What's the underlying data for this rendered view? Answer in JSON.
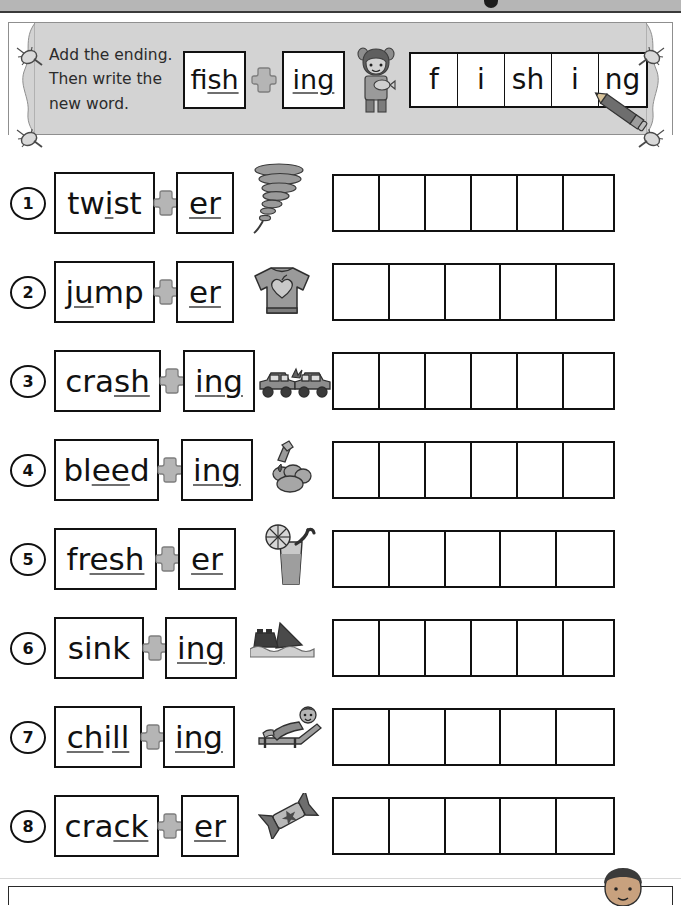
{
  "header": {
    "instruction_line1": "Add the ending.",
    "instruction_line2": "Then write the",
    "instruction_line3": "new word.",
    "example": {
      "base_word": "fish",
      "base_plain": "f",
      "base_underlined": "ish",
      "suffix": "ing",
      "suffix_underlined": "ing",
      "plus_icon": "plus-cross-icon",
      "picture_icon": "girl-with-fish-icon",
      "answer_cells": [
        "f",
        "i",
        "sh",
        "i",
        "ng"
      ],
      "pencil_icon": "pencil-icon"
    },
    "pins": [
      "pin-icon",
      "pin-icon",
      "pin-icon",
      "pin-icon"
    ]
  },
  "rows": [
    {
      "number": "1",
      "base_plain": "tw",
      "base_underlined": "i",
      "base_tail": "st",
      "base_word": "twist",
      "suffix": "er",
      "suffix_underlined": "er",
      "picture_icon": "tornado-twister-icon",
      "picture_label": "twister",
      "answer_cell_count": 6,
      "answer_cells": [
        "",
        "",
        "",
        "",
        "",
        ""
      ]
    },
    {
      "number": "2",
      "base_plain": "j",
      "base_underlined": "u",
      "base_tail": "mp",
      "base_word": "jump",
      "suffix": "er",
      "suffix_underlined": "er",
      "picture_icon": "jumper-sweater-icon",
      "picture_label": "jumper",
      "answer_cell_count": 5,
      "answer_cells": [
        "",
        "",
        "",
        "",
        ""
      ]
    },
    {
      "number": "3",
      "base_plain": "cra",
      "base_underlined": "sh",
      "base_tail": "",
      "base_word": "crash",
      "suffix": "ing",
      "suffix_underlined": "ing",
      "picture_icon": "car-crash-icon",
      "picture_label": "crashing",
      "answer_cell_count": 6,
      "answer_cells": [
        "",
        "",
        "",
        "",
        "",
        ""
      ]
    },
    {
      "number": "4",
      "base_plain": "bl",
      "base_underlined": "ee",
      "base_tail": "d",
      "base_word": "bleed",
      "suffix": "ing",
      "suffix_underlined": "ing",
      "picture_icon": "bleeding-finger-icon",
      "picture_label": "bleeding",
      "answer_cell_count": 6,
      "answer_cells": [
        "",
        "",
        "",
        "",
        "",
        ""
      ]
    },
    {
      "number": "5",
      "base_plain": "fr",
      "base_underlined": "esh",
      "base_tail": "",
      "base_word": "fresh",
      "suffix": "er",
      "suffix_underlined": "er",
      "picture_icon": "cold-drink-glass-icon",
      "picture_label": "fresher",
      "answer_cell_count": 5,
      "answer_cells": [
        "",
        "",
        "",
        "",
        ""
      ]
    },
    {
      "number": "6",
      "base_plain": "sink",
      "base_underlined": "",
      "base_tail": "",
      "base_word": "sink",
      "suffix": "ing",
      "suffix_underlined": "ing",
      "picture_icon": "sinking-boat-icon",
      "picture_label": "sinking",
      "answer_cell_count": 6,
      "answer_cells": [
        "",
        "",
        "",
        "",
        "",
        ""
      ]
    },
    {
      "number": "7",
      "base_plain": "",
      "base_underlined": "ch",
      "base_tail": "i",
      "base_word": "chill",
      "base_underlined2": "ll",
      "suffix": "ing",
      "suffix_underlined": "ing",
      "picture_icon": "person-on-lounger-icon",
      "picture_label": "chilling",
      "answer_cell_count": 5,
      "answer_cells": [
        "",
        "",
        "",
        "",
        ""
      ]
    },
    {
      "number": "8",
      "base_plain": "cra",
      "base_underlined": "ck",
      "base_tail": "",
      "base_word": "crack",
      "suffix": "er",
      "suffix_underlined": "er",
      "picture_icon": "wrapped-candy-cracker-icon",
      "picture_label": "cracker",
      "answer_cell_count": 5,
      "answer_cells": [
        "",
        "",
        "",
        "",
        ""
      ]
    }
  ],
  "colors": {
    "banner_bg": "#d3d3d3",
    "ink": "#111111",
    "plus_fill": "#b0b0b0",
    "page_bg": "#ffffff",
    "top_bar": "#b6b6b6"
  }
}
